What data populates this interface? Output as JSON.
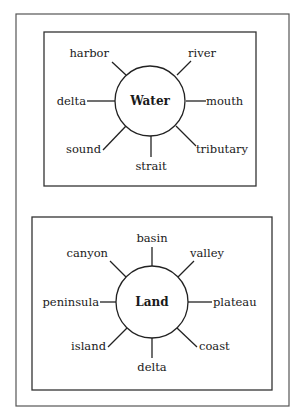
{
  "diagrams": [
    {
      "center": "Water",
      "labels": {
        "harbor": "harbor",
        "river": "river",
        "delta": "delta",
        "mouth": "mouth",
        "sound": "sound",
        "strait": "strait",
        "tributary": "tributary"
      }
    },
    {
      "center": "Land",
      "labels": {
        "basin": "basin",
        "canyon": "canyon",
        "valley": "valley",
        "peninsula": "peninsula",
        "plateau": "plateau",
        "island": "island",
        "delta": "delta",
        "coast": "coast"
      }
    }
  ]
}
